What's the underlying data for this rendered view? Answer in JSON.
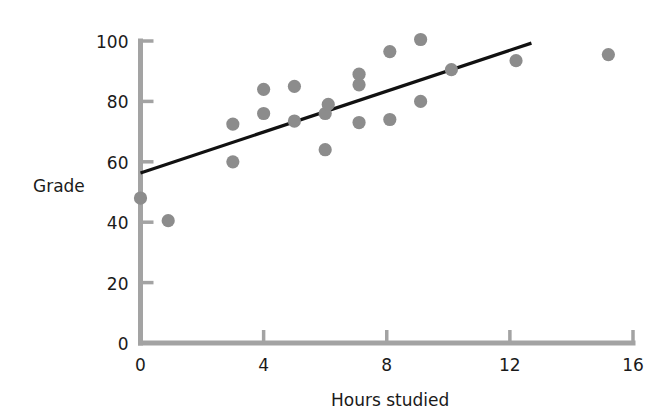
{
  "chart_data": {
    "type": "scatter",
    "title": "",
    "xlabel": "Hours studied",
    "ylabel": "Grade",
    "xlim": [
      0,
      16
    ],
    "ylim": [
      0,
      100
    ],
    "xticks": [
      0,
      4,
      8,
      12,
      16
    ],
    "yticks": [
      0,
      20,
      40,
      60,
      80,
      100
    ],
    "xtick_labels": [
      "0",
      "4",
      "8",
      "12",
      "16"
    ],
    "ytick_labels": [
      "0",
      "20",
      "40",
      "60",
      "80",
      "100"
    ],
    "grid": false,
    "legend": "none",
    "point_color": "#8c8c8c",
    "line_color": "#111111",
    "axis_color": "#a3a3a3",
    "text_color": "#1a1a1a",
    "points": [
      {
        "x": 0.0,
        "y": 48.0
      },
      {
        "x": 0.9,
        "y": 40.5
      },
      {
        "x": 3.0,
        "y": 60.0
      },
      {
        "x": 3.0,
        "y": 72.5
      },
      {
        "x": 4.0,
        "y": 76.0
      },
      {
        "x": 4.0,
        "y": 84.0
      },
      {
        "x": 5.0,
        "y": 73.5
      },
      {
        "x": 5.0,
        "y": 85.0
      },
      {
        "x": 6.0,
        "y": 64.0
      },
      {
        "x": 6.0,
        "y": 76.0
      },
      {
        "x": 6.1,
        "y": 79.0
      },
      {
        "x": 7.1,
        "y": 73.0
      },
      {
        "x": 7.1,
        "y": 85.5
      },
      {
        "x": 7.1,
        "y": 89.0
      },
      {
        "x": 8.1,
        "y": 74.0
      },
      {
        "x": 8.1,
        "y": 96.5
      },
      {
        "x": 9.1,
        "y": 80.0
      },
      {
        "x": 9.1,
        "y": 100.5
      },
      {
        "x": 10.1,
        "y": 90.5
      },
      {
        "x": 12.2,
        "y": 93.5
      },
      {
        "x": 15.2,
        "y": 95.5
      }
    ],
    "trendline": {
      "type": "line",
      "x_start": 0.0,
      "y_start": 56.3,
      "x_end": 12.7,
      "y_end": 99.3
    }
  },
  "plot": {
    "axes": {
      "x_label": "Hours studied",
      "y_label": "Grade"
    }
  }
}
